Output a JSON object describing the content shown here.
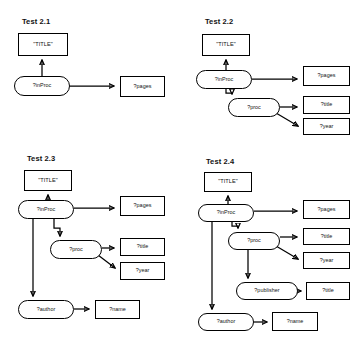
{
  "figure": {
    "background_color": "#ffffff",
    "stroke_color": "#000000",
    "node_fill": "#ffffff",
    "width": 361,
    "height": 353
  },
  "panels": [
    {
      "id": "test-2-1",
      "title": "Test 2.1",
      "nodes": [
        {
          "id": "t1-title",
          "label": "\"TITLE\"",
          "shape": "rect",
          "x": 18,
          "y": 33,
          "w": 50,
          "h": 23
        },
        {
          "id": "t1-inproc",
          "label": "?inProc",
          "shape": "oval",
          "x": 14,
          "y": 76,
          "w": 56,
          "h": 20
        },
        {
          "id": "t1-pages",
          "label": "?pages",
          "shape": "rect",
          "x": 120,
          "y": 76,
          "w": 45,
          "h": 21
        }
      ],
      "edges": [
        {
          "from": "t1-inproc",
          "to": "t1-title",
          "kind": "up"
        },
        {
          "from": "t1-inproc",
          "to": "t1-pages",
          "kind": "right"
        }
      ]
    },
    {
      "id": "test-2-2",
      "title": "Test 2.2",
      "nodes": [
        {
          "id": "t2-title",
          "label": "\"TITLE\"",
          "shape": "rect",
          "x": 202,
          "y": 34,
          "w": 48,
          "h": 22
        },
        {
          "id": "t2-inproc",
          "label": "?inProc",
          "shape": "oval",
          "x": 196,
          "y": 70,
          "w": 56,
          "h": 19
        },
        {
          "id": "t2-proc",
          "label": "?proc",
          "shape": "oval",
          "x": 228,
          "y": 98,
          "w": 52,
          "h": 19
        },
        {
          "id": "t2-pages",
          "label": "?pages",
          "shape": "rect",
          "x": 303,
          "y": 66,
          "w": 47,
          "h": 20
        },
        {
          "id": "t2-ptitle",
          "label": "?title",
          "shape": "rect",
          "x": 303,
          "y": 96,
          "w": 47,
          "h": 18
        },
        {
          "id": "t2-pyear",
          "label": "?year",
          "shape": "rect",
          "x": 303,
          "y": 118,
          "w": 47,
          "h": 17
        }
      ],
      "edges": [
        {
          "from": "t2-inproc",
          "to": "t2-title",
          "kind": "up"
        },
        {
          "from": "t2-inproc",
          "to": "t2-pages",
          "kind": "right"
        },
        {
          "from": "t2-inproc",
          "to": "t2-proc",
          "kind": "down-right"
        },
        {
          "from": "t2-proc",
          "to": "t2-ptitle",
          "kind": "right"
        },
        {
          "from": "t2-proc",
          "to": "t2-pyear",
          "kind": "diag-down-right"
        }
      ]
    },
    {
      "id": "test-2-3",
      "title": "Test 2.3",
      "nodes": [
        {
          "id": "t3-title",
          "label": "\"TITLE\"",
          "shape": "rect",
          "x": 24,
          "y": 170,
          "w": 48,
          "h": 21
        },
        {
          "id": "t3-inproc",
          "label": "?inProc",
          "shape": "oval",
          "x": 18,
          "y": 200,
          "w": 56,
          "h": 19
        },
        {
          "id": "t3-proc",
          "label": "?proc",
          "shape": "oval",
          "x": 50,
          "y": 240,
          "w": 52,
          "h": 19
        },
        {
          "id": "t3-author",
          "label": "?author",
          "shape": "oval",
          "x": 18,
          "y": 300,
          "w": 56,
          "h": 19
        },
        {
          "id": "t3-pages",
          "label": "?pages",
          "shape": "rect",
          "x": 120,
          "y": 196,
          "w": 45,
          "h": 20
        },
        {
          "id": "t3-ptitle",
          "label": "?title",
          "shape": "rect",
          "x": 120,
          "y": 238,
          "w": 45,
          "h": 18
        },
        {
          "id": "t3-pyear",
          "label": "?year",
          "shape": "rect",
          "x": 120,
          "y": 262,
          "w": 45,
          "h": 18
        },
        {
          "id": "t3-pname",
          "label": "?name",
          "shape": "rect",
          "x": 95,
          "y": 300,
          "w": 45,
          "h": 19
        }
      ],
      "edges": [
        {
          "from": "t3-inproc",
          "to": "t3-title",
          "kind": "up"
        },
        {
          "from": "t3-inproc",
          "to": "t3-pages",
          "kind": "right"
        },
        {
          "from": "t3-inproc",
          "to": "t3-proc",
          "kind": "down-right"
        },
        {
          "from": "t3-inproc",
          "to": "t3-author",
          "kind": "down-long"
        },
        {
          "from": "t3-proc",
          "to": "t3-ptitle",
          "kind": "right"
        },
        {
          "from": "t3-proc",
          "to": "t3-pyear",
          "kind": "diag-down-right"
        },
        {
          "from": "t3-author",
          "to": "t3-pname",
          "kind": "right"
        }
      ]
    },
    {
      "id": "test-2-4",
      "title": "Test 2.4",
      "nodes": [
        {
          "id": "t4-title",
          "label": "\"TITLE\"",
          "shape": "rect",
          "x": 204,
          "y": 172,
          "w": 48,
          "h": 20
        },
        {
          "id": "t4-inproc",
          "label": "?inProc",
          "shape": "oval",
          "x": 198,
          "y": 204,
          "w": 56,
          "h": 18
        },
        {
          "id": "t4-proc",
          "label": "?proc",
          "shape": "oval",
          "x": 228,
          "y": 232,
          "w": 52,
          "h": 18
        },
        {
          "id": "t4-publisher",
          "label": "?publisher",
          "shape": "oval",
          "x": 236,
          "y": 282,
          "w": 62,
          "h": 18
        },
        {
          "id": "t4-author",
          "label": "?author",
          "shape": "oval",
          "x": 198,
          "y": 313,
          "w": 56,
          "h": 18
        },
        {
          "id": "t4-pages",
          "label": "?pages",
          "shape": "rect",
          "x": 303,
          "y": 200,
          "w": 47,
          "h": 19
        },
        {
          "id": "t4-ptitle",
          "label": "?title",
          "shape": "rect",
          "x": 303,
          "y": 228,
          "w": 47,
          "h": 17
        },
        {
          "id": "t4-pyear",
          "label": "?year",
          "shape": "rect",
          "x": 303,
          "y": 252,
          "w": 47,
          "h": 17
        },
        {
          "id": "t4-ptitle2",
          "label": "?title",
          "shape": "rect",
          "x": 306,
          "y": 282,
          "w": 44,
          "h": 18
        },
        {
          "id": "t4-pname",
          "label": "?name",
          "shape": "rect",
          "x": 272,
          "y": 312,
          "w": 46,
          "h": 19
        }
      ],
      "edges": [
        {
          "from": "t4-inproc",
          "to": "t4-title",
          "kind": "up"
        },
        {
          "from": "t4-inproc",
          "to": "t4-pages",
          "kind": "right"
        },
        {
          "from": "t4-inproc",
          "to": "t4-proc",
          "kind": "down-right"
        },
        {
          "from": "t4-inproc",
          "to": "t4-author",
          "kind": "down-long"
        },
        {
          "from": "t4-proc",
          "to": "t4-ptitle",
          "kind": "right"
        },
        {
          "from": "t4-proc",
          "to": "t4-pyear",
          "kind": "diag-down-right"
        },
        {
          "from": "t4-proc",
          "to": "t4-publisher",
          "kind": "down"
        },
        {
          "from": "t4-publisher",
          "to": "t4-ptitle2",
          "kind": "right"
        },
        {
          "from": "t4-author",
          "to": "t4-pname",
          "kind": "right"
        }
      ]
    }
  ],
  "panel_titles": {
    "p1": "Test 2.1",
    "p2": "Test 2.2",
    "p3": "Test 2.3",
    "p4": "Test 2.4"
  },
  "title_positions": [
    {
      "id": "p1",
      "x": 22,
      "y": 18
    },
    {
      "id": "p2",
      "x": 205,
      "y": 18
    },
    {
      "id": "p3",
      "x": 27,
      "y": 155
    },
    {
      "id": "p4",
      "x": 206,
      "y": 158
    }
  ]
}
